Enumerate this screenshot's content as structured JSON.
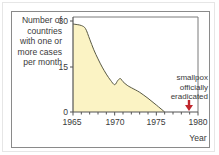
{
  "chart_data": {
    "type": "area",
    "title": "",
    "xlabel": "Year",
    "ylabel": "Number of countries with one or more cases per month",
    "x_ticks": [
      1965,
      1970,
      1975,
      1980
    ],
    "y_ticks": [
      0,
      15,
      30
    ],
    "xlim": [
      1965,
      1980
    ],
    "ylim": [
      0,
      30
    ],
    "grid": false,
    "legend": null,
    "series": [
      {
        "name": "Countries with smallpox cases",
        "x": [
          1965,
          1965.5,
          1966,
          1966.5,
          1967,
          1967.5,
          1968,
          1968.5,
          1969,
          1969.5,
          1970,
          1970.4,
          1970.7,
          1971,
          1971.5,
          1972,
          1973,
          1974,
          1975,
          1976
        ],
        "values": [
          29,
          28.8,
          28.5,
          27.5,
          24,
          20.5,
          17.5,
          14.8,
          12.5,
          10.5,
          9,
          10.5,
          11,
          10,
          8.8,
          8,
          6.5,
          4.5,
          2.3,
          0
        ]
      }
    ],
    "annotations": [
      {
        "text": "smallpox officially eradicated",
        "x": 1979,
        "marker": "red-down-arrow"
      }
    ],
    "colors": {
      "fill": "#fbf3c4",
      "line": "#5a5a45",
      "arrow": "#c0272d",
      "axis": "#555555"
    }
  },
  "labels": {
    "ylabel_line1": "Number of",
    "ylabel_line2": "countries",
    "ylabel_line3": "with one or",
    "ylabel_line4": "more cases",
    "ylabel_line5": "per month",
    "annot_line1": "smallpox",
    "annot_line2": "officially",
    "annot_line3": "eradicated",
    "xlabel": "Year",
    "x_tick_1965": "1965",
    "x_tick_1970": "1970",
    "x_tick_1975": "1975",
    "x_tick_1980": "1980",
    "y_tick_0": "0",
    "y_tick_15": "15",
    "y_tick_30": "30"
  }
}
